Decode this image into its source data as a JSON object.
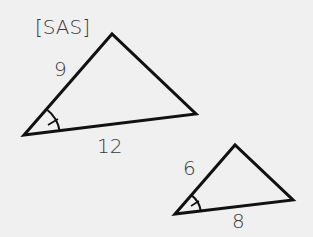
{
  "diagram": {
    "title": "[SAS]",
    "triangles": [
      {
        "name": "large",
        "side_labels": {
          "left": "9",
          "bottom": "12"
        },
        "marked_angle": "included angle (single arc with tick)"
      },
      {
        "name": "small",
        "side_labels": {
          "left": "6",
          "bottom": "8"
        },
        "marked_angle": "included angle (single arc with tick)"
      }
    ],
    "colors": {
      "background": "#f0f0f0",
      "stroke": "#111111",
      "text": "#3a3a3a"
    }
  }
}
